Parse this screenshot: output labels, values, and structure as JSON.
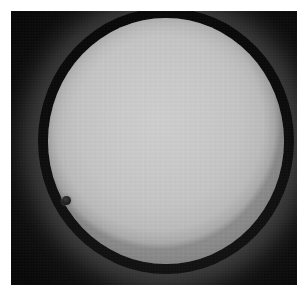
{
  "image": {
    "subject": "transit-of-venus",
    "caption": "Silhouette of Venus crossing the solar disk",
    "medium": "black-and-white photographic plate",
    "canvas": {
      "width": 307,
      "height": 294
    },
    "border": {
      "color": "#ffffff",
      "left": 11,
      "top": 11,
      "right": 10,
      "bottom": 9
    }
  },
  "sky": {
    "label": "dark sky background",
    "color": "#070707",
    "glow_color": "#5a5a5a"
  },
  "solar_disk": {
    "label": "solar disk",
    "center_x": 166,
    "center_y": 141,
    "radius_x": 118,
    "radius_y": 123,
    "fill_color": "#c9c9c9",
    "limb_color": "#8e8e8e"
  },
  "transit_object": {
    "label": "Venus",
    "center_x": 66,
    "center_y": 200,
    "diameter": 9,
    "color": "#242424"
  }
}
